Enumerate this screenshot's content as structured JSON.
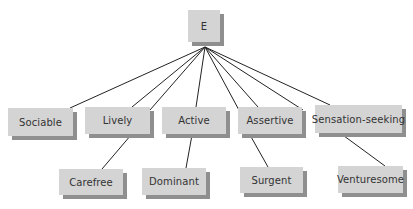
{
  "diagram": {
    "type": "hierarchy",
    "colors": {
      "box_fill": "#d4d4d4",
      "box_shadow": "#8f8f8f",
      "line": "#222222",
      "text": "#333333"
    },
    "root": {
      "label": "E",
      "box": {
        "x": 188,
        "y": 10,
        "w": 32,
        "h": 32
      }
    },
    "apex": {
      "x": 205,
      "y": 47
    },
    "facets": [
      {
        "label": "Sociable",
        "box": {
          "x": 8,
          "y": 108,
          "w": 65,
          "h": 28
        }
      },
      {
        "label": "Lively",
        "box": {
          "x": 85,
          "y": 107,
          "w": 65,
          "h": 27
        }
      },
      {
        "label": "Active",
        "box": {
          "x": 162,
          "y": 107,
          "w": 64,
          "h": 27
        }
      },
      {
        "label": "Assertive",
        "box": {
          "x": 238,
          "y": 107,
          "w": 64,
          "h": 27
        }
      },
      {
        "label": "Sensation-seeking",
        "box": {
          "x": 315,
          "y": 105,
          "w": 87,
          "h": 28
        }
      }
    ],
    "subfacets": [
      {
        "label": "Carefree",
        "box": {
          "x": 59,
          "y": 169,
          "w": 64,
          "h": 26
        }
      },
      {
        "label": "Dominant",
        "box": {
          "x": 142,
          "y": 168,
          "w": 64,
          "h": 27
        }
      },
      {
        "label": "Surgent",
        "box": {
          "x": 240,
          "y": 167,
          "w": 63,
          "h": 26
        }
      },
      {
        "label": "Venturesome",
        "box": {
          "x": 338,
          "y": 166,
          "w": 65,
          "h": 27
        }
      }
    ],
    "root_lines": [
      {
        "x2": 70,
        "y2": 108
      },
      {
        "x2": 132,
        "y2": 107
      },
      {
        "x2": 150,
        "y2": 110
      },
      {
        "x2": 196,
        "y2": 107
      },
      {
        "x2": 240,
        "y2": 112
      },
      {
        "x2": 258,
        "y2": 107
      },
      {
        "x2": 303,
        "y2": 110
      },
      {
        "x2": 330,
        "y2": 105
      }
    ],
    "child_lines": [
      {
        "x1": 131,
        "y1": 135,
        "x2": 102,
        "y2": 169
      },
      {
        "x1": 192,
        "y1": 135,
        "x2": 186,
        "y2": 168
      },
      {
        "x1": 250,
        "y1": 135,
        "x2": 268,
        "y2": 167
      },
      {
        "x1": 340,
        "y1": 133,
        "x2": 385,
        "y2": 166
      }
    ]
  }
}
